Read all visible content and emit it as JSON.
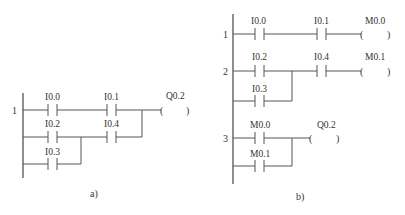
{
  "panels": [
    {
      "caption": "a)",
      "rungs": [
        {
          "number": "1",
          "contacts": [
            "I0.0",
            "I0.1",
            "I0.2",
            "I0.4",
            "I0.3"
          ],
          "coil": "Q0.2"
        }
      ]
    },
    {
      "caption": "b)",
      "rungs": [
        {
          "number": "1",
          "contacts": [
            "I0.0",
            "I0.1"
          ],
          "coil": "M0.0"
        },
        {
          "number": "2",
          "contacts": [
            "I0.2",
            "I0.4",
            "I0.3"
          ],
          "coil": "M0.1"
        },
        {
          "number": "3",
          "contacts": [
            "M0.0",
            "M0.1"
          ],
          "coil": "Q0.2"
        }
      ]
    }
  ],
  "coil_symbol": {
    "open": "(",
    "close": ")"
  }
}
